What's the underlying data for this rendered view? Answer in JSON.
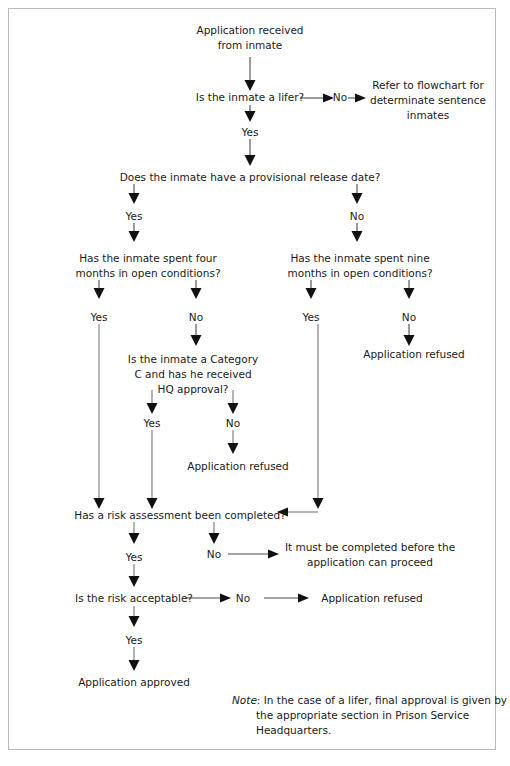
{
  "document": {
    "type": "flowchart",
    "title": "Application for temporary release / open conditions decision flowchart",
    "border_color": "#b9b9b9",
    "text_color": "#1a1a1a",
    "line_color": "#4a4a4a"
  },
  "nodes": {
    "start_line1": "Application received",
    "start_line2": "from inmate",
    "q_lifer": "Is the inmate a lifer?",
    "refer_line1": "Refer to flowchart for",
    "refer_line2": "determinate sentence",
    "refer_line3": "inmates",
    "q_release_date": "Does the inmate have a provisional release date?",
    "q_four_months_line1": "Has the inmate spent four",
    "q_four_months_line2": "months in open conditions?",
    "q_nine_months_line1": "Has the inmate spent nine",
    "q_nine_months_line2": "months in open conditions?",
    "refused_nine_no": "Application refused",
    "q_category_line1": "Is the inmate a Category",
    "q_category_line2": "C and has he received",
    "q_category_line3": "HQ approval?",
    "refused_category_no": "Application refused",
    "q_risk_assessment": "Has a risk assessment been completed?",
    "must_complete_line1": "It must be completed before the",
    "must_complete_line2": "application can proceed",
    "q_risk_acceptable": "Is the risk acceptable?",
    "refused_risk": "Application refused",
    "approved": "Application approved"
  },
  "edge_labels": {
    "lifer_no": "No",
    "lifer_yes": "Yes",
    "release_yes": "Yes",
    "release_no": "No",
    "four_yes": "Yes",
    "four_no": "No",
    "nine_yes": "Yes",
    "nine_no": "No",
    "category_yes": "Yes",
    "category_no": "No",
    "risk_assessment_yes": "Yes",
    "risk_assessment_no": "No",
    "risk_acceptable_yes": "Yes",
    "risk_acceptable_no": "No"
  },
  "note": {
    "prefix": "Note",
    "separator": ":",
    "line1": " In the case of a lifer, final approval is given by",
    "line2": "the appropriate section in Prison Service",
    "line3": "Headquarters."
  }
}
